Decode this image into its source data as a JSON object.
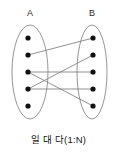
{
  "diagram": {
    "type": "set-mapping",
    "caption": "일 대 다(1:N)",
    "sets": [
      {
        "id": "A",
        "label": "A",
        "label_x": 30,
        "label_y": 14,
        "ellipse": {
          "cx": 30,
          "cy": 72,
          "rx": 18,
          "ry": 47
        },
        "nodes": [
          {
            "id": "A1",
            "x": 28,
            "y": 38,
            "r": 2.6
          },
          {
            "id": "A2",
            "x": 28,
            "y": 55,
            "r": 2.6
          },
          {
            "id": "A3",
            "x": 28,
            "y": 72,
            "r": 2.6
          },
          {
            "id": "A4",
            "x": 28,
            "y": 89,
            "r": 2.6
          },
          {
            "id": "A5",
            "x": 28,
            "y": 106,
            "r": 2.6
          }
        ]
      },
      {
        "id": "B",
        "label": "B",
        "label_x": 92,
        "label_y": 14,
        "ellipse": {
          "cx": 92,
          "cy": 72,
          "rx": 15,
          "ry": 47
        },
        "nodes": [
          {
            "id": "B1",
            "x": 93,
            "y": 38,
            "r": 2.6
          },
          {
            "id": "B2",
            "x": 93,
            "y": 55,
            "r": 2.6
          },
          {
            "id": "B3",
            "x": 93,
            "y": 72,
            "r": 2.6
          },
          {
            "id": "B4",
            "x": 93,
            "y": 89,
            "r": 2.6
          },
          {
            "id": "B5",
            "x": 93,
            "y": 106,
            "r": 2.6
          }
        ]
      }
    ],
    "edges": [
      {
        "id": "edge-a2-b1",
        "from": "A2",
        "to": "B1",
        "x1": 28,
        "y1": 55,
        "x2": 93,
        "y2": 38
      },
      {
        "id": "edge-a4-b2",
        "from": "A4",
        "to": "B2",
        "x1": 28,
        "y1": 89,
        "x2": 93,
        "y2": 55
      },
      {
        "id": "edge-a3-b3",
        "from": "A3",
        "to": "B3",
        "x1": 28,
        "y1": 72,
        "x2": 93,
        "y2": 72
      },
      {
        "id": "edge-a4-b4",
        "from": "A4",
        "to": "B4",
        "x1": 28,
        "y1": 89,
        "x2": 93,
        "y2": 89
      },
      {
        "id": "edge-a3-b5",
        "from": "A3",
        "to": "B5",
        "x1": 28,
        "y1": 72,
        "x2": 93,
        "y2": 106
      }
    ],
    "colors": {
      "outline": "#8a8a8a",
      "edge": "#7d7d7d",
      "node": "#111111",
      "text": "#141414",
      "background": "#ffffff"
    }
  }
}
